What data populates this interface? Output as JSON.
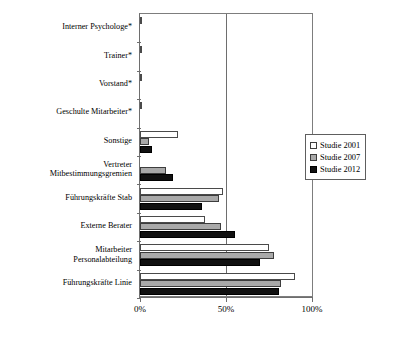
{
  "chart_data": {
    "type": "bar",
    "orientation": "horizontal",
    "title": "",
    "xlabel": "",
    "ylabel": "",
    "xlim": [
      0,
      100
    ],
    "xticks": [
      0,
      50,
      100
    ],
    "xtick_labels": [
      "0%",
      "50%",
      "100%"
    ],
    "grid": true,
    "gridlines": [
      "50%"
    ],
    "legend_position": "right",
    "categories": [
      "Interner Psychologe*",
      "Trainer*",
      "Vorstand*",
      "Geschulte Mitarbeiter*",
      "Sonstige",
      "Vertreter\nMitbestimmungsgremien",
      "Führungskräfte Stab",
      "Externe Berater",
      "Mitarbeiter\nPersonalabteilung",
      "Führungskräfte Linie"
    ],
    "series": [
      {
        "name": "Studie 2001",
        "color": "#ffffff",
        "values": [
          1,
          1,
          1,
          1,
          22,
          0,
          48,
          38,
          75,
          90
        ]
      },
      {
        "name": "Studie 2007",
        "color": "#a9a9a9",
        "values": [
          0,
          0,
          0,
          0,
          5,
          15,
          46,
          47,
          78,
          82
        ]
      },
      {
        "name": "Studie 2012",
        "color": "#111111",
        "values": [
          0,
          0,
          0,
          0,
          7,
          19,
          36,
          55,
          70,
          81
        ]
      }
    ],
    "legend_entries": [
      "Studie 2001",
      "Studie 2007",
      "Studie 2012"
    ]
  },
  "legend": {
    "items": [
      {
        "label": "Studie 2001",
        "swatch": "white-square-icon"
      },
      {
        "label": "Studie 2007",
        "swatch": "gray-square-icon"
      },
      {
        "label": "Studie 2012",
        "swatch": "black-square-icon"
      }
    ]
  },
  "axis": {
    "x_tick_labels": [
      "0%",
      "50%",
      "100%"
    ]
  },
  "colors": {
    "series_2001": "#ffffff",
    "series_2007": "#a9a9a9",
    "series_2012": "#111111",
    "axis": "#6e6e6e",
    "text": "#000000",
    "background": "#ffffff"
  }
}
